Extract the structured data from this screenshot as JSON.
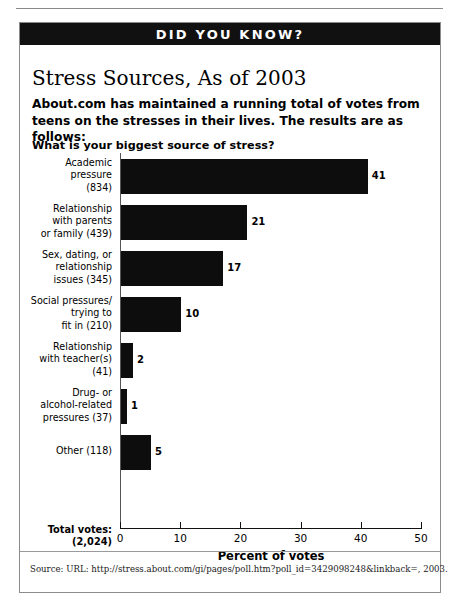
{
  "banner": {
    "label": "DID YOU KNOW?"
  },
  "headline": "Stress Sources, As of 2003",
  "intro": "About.com has maintained a running total of votes from teens on the stresses in their lives. The results are as follows:",
  "question": "What is your biggest source of stress?",
  "total_votes_label": "Total votes:\n(2,024)",
  "total_votes_line1": "Total votes:",
  "total_votes_line2": "(2,024)",
  "source": "Source:  URL: http://stress.about.com/gi/pages/poll.htm?poll_id=3429098248&linkback=, 2003.",
  "chart_data": {
    "type": "bar",
    "orientation": "horizontal",
    "title": "What is your biggest source of stress?",
    "xlabel": "Percent of votes",
    "ylabel": "",
    "xlim": [
      0,
      50
    ],
    "xticks": [
      0,
      10,
      20,
      30,
      40,
      50
    ],
    "xtick_labels": [
      "0",
      "10",
      "20",
      "30",
      "40",
      "50"
    ],
    "grid": false,
    "legend": false,
    "bar_color": "#0d0d0d",
    "total_votes": 2024,
    "categories": [
      "Academic\npressure\n(834)",
      "Relationship\nwith parents\nor family (439)",
      "Sex, dating, or\nrelationship\nissues (345)",
      "Social pressures/\ntrying to\nfit in (210)",
      "Relationship\nwith teacher(s)\n(41)",
      "Drug- or\nalcohol-related\npressures (37)",
      "Other (118)"
    ],
    "points": [
      {
        "label_lines": [
          "Academic",
          "pressure",
          "(834)"
        ],
        "votes": 834,
        "value": 41,
        "value_label": "41"
      },
      {
        "label_lines": [
          "Relationship",
          "with parents",
          "or family (439)"
        ],
        "votes": 439,
        "value": 21,
        "value_label": "21"
      },
      {
        "label_lines": [
          "Sex, dating, or",
          "relationship",
          "issues (345)"
        ],
        "votes": 345,
        "value": 17,
        "value_label": "17"
      },
      {
        "label_lines": [
          "Social pressures/",
          "trying to",
          "fit in (210)"
        ],
        "votes": 210,
        "value": 10,
        "value_label": "10"
      },
      {
        "label_lines": [
          "Relationship",
          "with teacher(s)",
          "(41)"
        ],
        "votes": 41,
        "value": 2,
        "value_label": "2"
      },
      {
        "label_lines": [
          "Drug- or",
          "alcohol-related",
          "pressures (37)"
        ],
        "votes": 37,
        "value": 1,
        "value_label": "1"
      },
      {
        "label_lines": [
          "Other (118)"
        ],
        "votes": 118,
        "value": 5,
        "value_label": "5"
      }
    ],
    "values": [
      41,
      21,
      17,
      10,
      2,
      1,
      5
    ]
  }
}
